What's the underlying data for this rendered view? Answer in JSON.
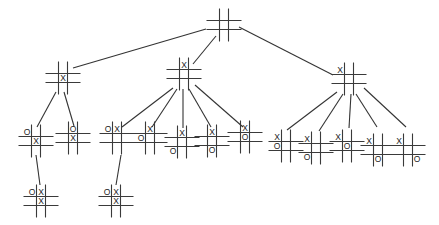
{
  "colors": {
    "line": "#333333",
    "background": "#ffffff",
    "mark": "#222222"
  },
  "nodes": [
    {
      "id": "root",
      "level": 0,
      "x": 224,
      "y": 25,
      "board": [
        "",
        "",
        "",
        "",
        "",
        "",
        "",
        "",
        ""
      ]
    },
    {
      "id": "n1",
      "level": 1,
      "x": 63,
      "y": 78,
      "board": [
        "",
        "",
        "",
        "",
        "X",
        "",
        "",
        "",
        ""
      ]
    },
    {
      "id": "n2",
      "level": 1,
      "x": 184,
      "y": 74,
      "board": [
        "",
        "X",
        "",
        "",
        "",
        "",
        "",
        "",
        ""
      ]
    },
    {
      "id": "n3",
      "level": 1,
      "x": 349,
      "y": 79,
      "board": [
        "X",
        "",
        "",
        "",
        "",
        "",
        "",
        "",
        ""
      ]
    },
    {
      "id": "n1a",
      "level": 2,
      "x": 36,
      "y": 141,
      "board": [
        "O",
        "",
        "",
        "",
        "X",
        "",
        "",
        "",
        ""
      ]
    },
    {
      "id": "n1b",
      "level": 2,
      "x": 73,
      "y": 138,
      "board": [
        "",
        "O",
        "",
        "",
        "X",
        "",
        "",
        "",
        ""
      ]
    },
    {
      "id": "n2a",
      "level": 2,
      "x": 117,
      "y": 138,
      "board": [
        "O",
        "X",
        "",
        "",
        "",
        "",
        "",
        "",
        ""
      ]
    },
    {
      "id": "n2b",
      "level": 2,
      "x": 150,
      "y": 138,
      "board": [
        "",
        "X",
        "",
        "O",
        "",
        "",
        "",
        "",
        ""
      ]
    },
    {
      "id": "n2c",
      "level": 2,
      "x": 182,
      "y": 142,
      "board": [
        "",
        "X",
        "",
        "",
        "",
        "",
        "O",
        "",
        ""
      ]
    },
    {
      "id": "n2d",
      "level": 2,
      "x": 212,
      "y": 141,
      "board": [
        "",
        "X",
        "",
        "",
        "",
        "",
        "",
        "O",
        ""
      ]
    },
    {
      "id": "n2e",
      "level": 2,
      "x": 245,
      "y": 137,
      "board": [
        "",
        "X",
        "",
        "",
        "O",
        "",
        "",
        "",
        ""
      ]
    },
    {
      "id": "n3a",
      "level": 2,
      "x": 286,
      "y": 146,
      "board": [
        "X",
        "",
        "",
        "O",
        "",
        "",
        "",
        "",
        ""
      ]
    },
    {
      "id": "n3b",
      "level": 2,
      "x": 316,
      "y": 148,
      "board": [
        "X",
        "",
        "",
        "",
        "",
        "",
        "O",
        "",
        ""
      ]
    },
    {
      "id": "n3c",
      "level": 2,
      "x": 347,
      "y": 146,
      "board": [
        "X",
        "",
        "",
        "",
        "O",
        "",
        "",
        "",
        ""
      ]
    },
    {
      "id": "n3d",
      "level": 2,
      "x": 378,
      "y": 150,
      "board": [
        "X",
        "",
        "",
        "",
        "",
        "",
        "",
        "O",
        ""
      ]
    },
    {
      "id": "n3e",
      "level": 2,
      "x": 408,
      "y": 150,
      "board": [
        "X",
        "",
        "",
        "",
        "",
        "",
        "",
        "",
        "O"
      ]
    },
    {
      "id": "n1a1",
      "level": 3,
      "x": 41,
      "y": 201,
      "board": [
        "O",
        "X",
        "",
        "",
        "X",
        "",
        "",
        "",
        ""
      ]
    },
    {
      "id": "n2a1",
      "level": 3,
      "x": 116,
      "y": 201,
      "board": [
        "O",
        "X",
        "",
        "",
        "X",
        "",
        "",
        "",
        ""
      ]
    }
  ],
  "edges": [
    {
      "from": "root",
      "to": "n1",
      "x1": 206,
      "y1": 29,
      "x2": 73,
      "y2": 68
    },
    {
      "from": "root",
      "to": "n2",
      "x1": 216,
      "y1": 36,
      "x2": 193,
      "y2": 64
    },
    {
      "from": "root",
      "to": "n3",
      "x1": 239,
      "y1": 27,
      "x2": 333,
      "y2": 75
    },
    {
      "from": "n1",
      "to": "n1a",
      "x1": 56,
      "y1": 92,
      "x2": 37,
      "y2": 127
    },
    {
      "from": "n1",
      "to": "n1b",
      "x1": 64,
      "y1": 92,
      "x2": 74,
      "y2": 126
    },
    {
      "from": "n2",
      "to": "n2a",
      "x1": 173,
      "y1": 88,
      "x2": 122,
      "y2": 127
    },
    {
      "from": "n2",
      "to": "n2b",
      "x1": 177,
      "y1": 89,
      "x2": 152,
      "y2": 127
    },
    {
      "from": "n2",
      "to": "n2c",
      "x1": 183,
      "y1": 89,
      "x2": 183,
      "y2": 128
    },
    {
      "from": "n2",
      "to": "n2d",
      "x1": 189,
      "y1": 89,
      "x2": 211,
      "y2": 127
    },
    {
      "from": "n2",
      "to": "n2e",
      "x1": 195,
      "y1": 85,
      "x2": 243,
      "y2": 127
    },
    {
      "from": "n3",
      "to": "n3a",
      "x1": 337,
      "y1": 92,
      "x2": 287,
      "y2": 130
    },
    {
      "from": "n3",
      "to": "n3b",
      "x1": 343,
      "y1": 94,
      "x2": 319,
      "y2": 131
    },
    {
      "from": "n3",
      "to": "n3c",
      "x1": 351,
      "y1": 94,
      "x2": 349,
      "y2": 128
    },
    {
      "from": "n3",
      "to": "n3d",
      "x1": 356,
      "y1": 94,
      "x2": 377,
      "y2": 127
    },
    {
      "from": "n3",
      "to": "n3e",
      "x1": 364,
      "y1": 88,
      "x2": 406,
      "y2": 127
    },
    {
      "from": "n1a",
      "to": "n1a1",
      "x1": 36,
      "y1": 155,
      "x2": 40,
      "y2": 185
    },
    {
      "from": "n2a",
      "to": "n2a1",
      "x1": 121,
      "y1": 155,
      "x2": 116,
      "y2": 185
    }
  ]
}
